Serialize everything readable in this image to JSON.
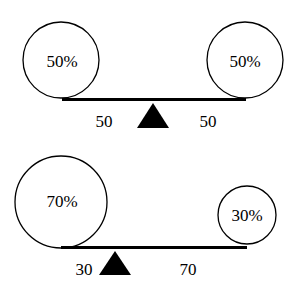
{
  "diagrams": [
    {
      "name": "balanced-seesaw",
      "left_weight": "50%",
      "right_weight": "50%",
      "left_distance": "50",
      "right_distance": "50"
    },
    {
      "name": "unbalanced-seesaw",
      "left_weight": "70%",
      "right_weight": "30%",
      "left_distance": "30",
      "right_distance": "70"
    }
  ],
  "colors": {
    "stroke": "#000000",
    "fulcrum": "#000000",
    "background": "#ffffff"
  }
}
